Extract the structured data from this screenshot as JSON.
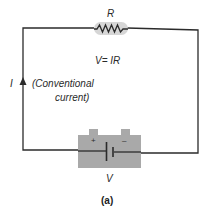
{
  "diagram": {
    "type": "circuit",
    "resistor": {
      "label": "R"
    },
    "equation": "V= IR",
    "current": {
      "symbol": "I",
      "description_line1": "(Conventional",
      "description_line2": "current)"
    },
    "battery": {
      "label": "V",
      "positive": "+",
      "negative": "–"
    },
    "caption": "(a)",
    "colors": {
      "wire": "#2b2b2b",
      "battery_body": "#a9a9a9",
      "resistor_highlight": "#d6d6d6",
      "text": "#2a2a2a"
    }
  }
}
